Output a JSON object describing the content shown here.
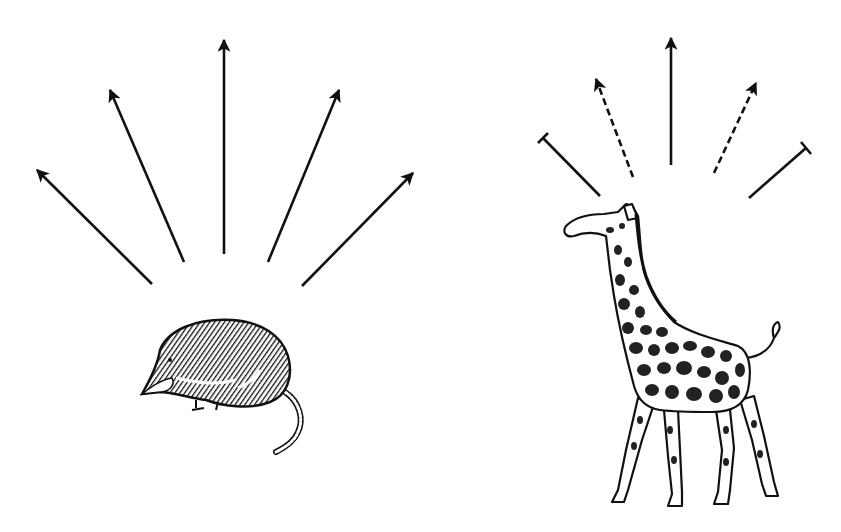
{
  "figure": {
    "panels": [
      {
        "id": "left",
        "subject": "shrew",
        "arrow_types": [
          "solid",
          "solid",
          "solid",
          "solid",
          "solid"
        ]
      },
      {
        "id": "right",
        "subject": "giraffe",
        "arrow_types": [
          "blocked",
          "dashed",
          "solid",
          "dashed",
          "blocked"
        ]
      }
    ],
    "colors": {
      "ink": "#111111",
      "background": "#ffffff"
    }
  }
}
